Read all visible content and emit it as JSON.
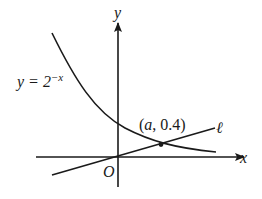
{
  "figure": {
    "axes": {
      "x_label": "x",
      "y_label": "y",
      "origin_label": "O"
    },
    "curve": {
      "label_lhs": "y = 2",
      "label_exp": "−x"
    },
    "line": {
      "label": "ℓ"
    },
    "intersection": {
      "label_open": "(",
      "label_var": "a",
      "label_rest": ", 0.4)"
    },
    "colors": {
      "ink": "#1a1a1a",
      "background": "#ffffff"
    }
  }
}
